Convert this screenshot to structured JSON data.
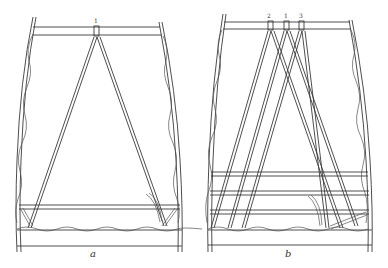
{
  "figure": {
    "panels": [
      {
        "id": "a",
        "label": "a",
        "strand_labels": [
          "1"
        ]
      },
      {
        "id": "b",
        "label": "b",
        "strand_labels": [
          "2",
          "1",
          "3"
        ]
      }
    ]
  },
  "colors": {
    "ink": "#3a3a3a",
    "background": "#ffffff"
  }
}
